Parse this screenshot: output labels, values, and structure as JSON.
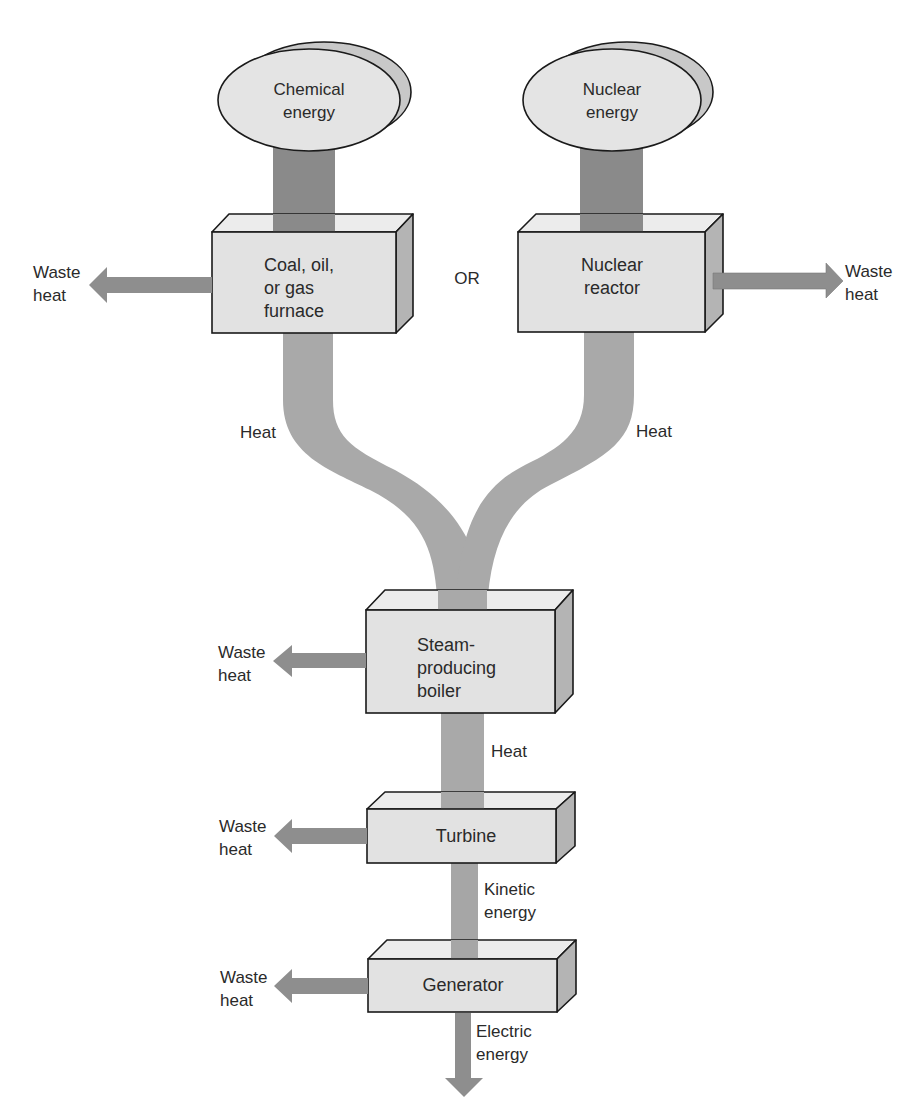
{
  "diagram": {
    "type": "energy-flow",
    "colors": {
      "box_face": "#e2e2e2",
      "box_top": "#ececec",
      "box_side": "#b4b4b4",
      "outline": "#1a1a1a",
      "source_pillar": "#8a8a8a",
      "heat_pipe": "#a9a9a9",
      "arrow": "#8e8e8e",
      "ellipse_front": "#e4e4e4",
      "ellipse_back": "#c8c8c8",
      "text": "#2a2a2a"
    },
    "sources": [
      {
        "id": "chemical",
        "line1": "Chemical",
        "line2": "energy"
      },
      {
        "id": "nuclear",
        "line1": "Nuclear",
        "line2": "energy"
      }
    ],
    "or_label": "OR",
    "boxes": {
      "furnace": {
        "line1": "Coal, oil,",
        "line2": "or gas",
        "line3": "furnace"
      },
      "reactor": {
        "line1": "Nuclear",
        "line2": "reactor"
      },
      "boiler": {
        "line1": "Steam-",
        "line2": "producing",
        "line3": "boiler"
      },
      "turbine": {
        "line1": "Turbine"
      },
      "generator": {
        "line1": "Generator"
      }
    },
    "flow_labels": {
      "heat_left": "Heat",
      "heat_right": "Heat",
      "heat_boiler": "Heat",
      "kinetic_line1": "Kinetic",
      "kinetic_line2": "energy",
      "electric_line1": "Electric",
      "electric_line2": "energy"
    },
    "waste_heat": {
      "line1": "Waste",
      "line2": "heat"
    }
  }
}
